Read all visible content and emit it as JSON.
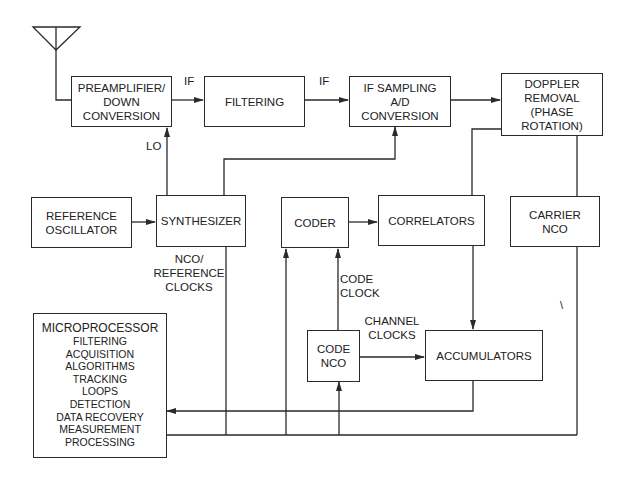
{
  "diagram": {
    "title": "",
    "blocks": {
      "preamp": {
        "lines": [
          "PREAMPLIFIER/",
          "DOWN",
          "CONVERSION"
        ]
      },
      "filtering": {
        "lines": [
          "FILTERING"
        ]
      },
      "if_sampling": {
        "lines": [
          "IF SAMPLING",
          "A/D",
          "CONVERSION"
        ]
      },
      "doppler": {
        "lines": [
          "DOPPLER",
          "REMOVAL",
          "(PHASE",
          "ROTATION)"
        ]
      },
      "ref_osc": {
        "lines": [
          "REFERENCE",
          "OSCILLATOR"
        ]
      },
      "synth": {
        "lines": [
          "SYNTHESIZER"
        ]
      },
      "coder": {
        "lines": [
          "CODER"
        ]
      },
      "correlators": {
        "lines": [
          "CORRELATORS"
        ]
      },
      "carrier_nco": {
        "lines": [
          "CARRIER",
          "NCO"
        ]
      },
      "code_nco": {
        "lines": [
          "CODE",
          "NCO"
        ]
      },
      "accumulators": {
        "lines": [
          "ACCUMULATORS"
        ]
      },
      "microprocessor": {
        "title": "MICROPROCESSOR",
        "lines": [
          "FILTERING",
          "ACQUISITION",
          "ALGORITHMS",
          "TRACKING",
          "LOOPS",
          "DETECTION",
          "DATA RECOVERY",
          "MEASUREMENT",
          "PROCESSING"
        ]
      }
    },
    "labels": {
      "if1": "IF",
      "if2": "IF",
      "lo": "LO",
      "nco_ref": [
        "NCO/",
        "REFERENCE",
        "CLOCKS"
      ],
      "code_clock": [
        "CODE",
        "CLOCK"
      ],
      "channel_clocks": [
        "CHANNEL",
        "CLOCKS"
      ],
      "stray_mark": "\\"
    },
    "colors": {
      "line": "#2a2a2a",
      "background": "#ffffff"
    }
  }
}
